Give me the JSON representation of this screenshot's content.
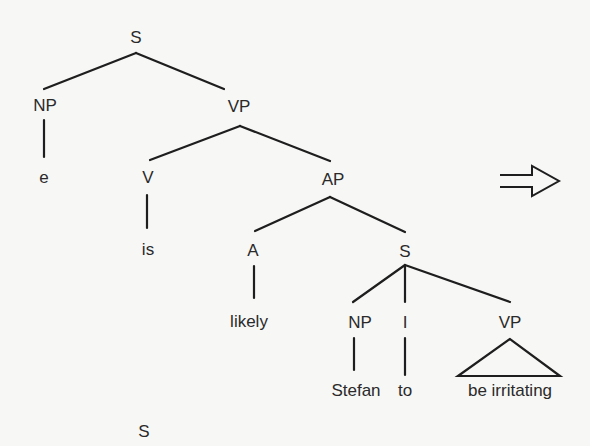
{
  "diagram": {
    "type": "syntax-tree",
    "line_color": "#1e1e1e",
    "nodes": {
      "s_root": "S",
      "np_subject": "NP",
      "empty": "e",
      "vp_main": "VP",
      "v": "V",
      "is": "is",
      "ap": "AP",
      "a": "A",
      "likely": "likely",
      "s_embedded": "S",
      "np_embedded": "NP",
      "stefan": "Stefan",
      "i": "I",
      "to": "to",
      "vp_embedded": "VP",
      "be_irritating": "be irritating",
      "s_next_tree": "S"
    },
    "arrow": "double-right-arrow"
  }
}
